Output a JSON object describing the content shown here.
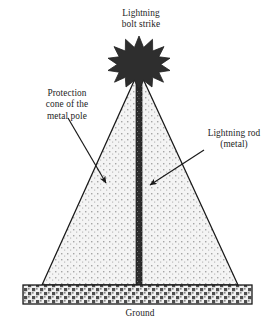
{
  "figure": {
    "title_label": "Lightning\nbolt strike",
    "cone_label": "Protection\ncone of the\nmetal pole",
    "rod_label": "Lightning rod\n(metal)",
    "ground_label": "Ground",
    "colors": {
      "background": "#ffffff",
      "outline": "#1a1a1a",
      "burst_fill": "#2e2e2e",
      "cone_fill": "#f2f2f2",
      "cone_stipple": "#9a9a9a",
      "rod_fill": "#2a2a2a",
      "ground_fill": "#efefef",
      "ground_hatch": "#4a4a4a",
      "text": "#1d1d1d"
    },
    "geometry": {
      "cone_apex_x": 139,
      "cone_apex_y": 70,
      "cone_base_left_x": 42,
      "cone_base_right_x": 238,
      "cone_base_y": 285,
      "rod_top_y": 62,
      "rod_bottom_y": 285,
      "rod_width": 6,
      "ground_left_x": 23,
      "ground_right_x": 252,
      "ground_top_y": 285,
      "ground_height": 19,
      "burst_center_x": 139,
      "burst_center_y": 57,
      "burst_outer_radius": 21,
      "burst_inner_radius": 11,
      "burst_points": 12
    },
    "annotations": [
      {
        "name": "protection-cone",
        "start_x": 68,
        "start_y": 118,
        "end_x": 106,
        "end_y": 183
      },
      {
        "name": "lightning-rod",
        "start_x": 204,
        "start_y": 150,
        "end_x": 150,
        "end_y": 185
      }
    ]
  }
}
